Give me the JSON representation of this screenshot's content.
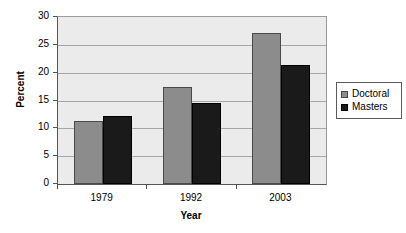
{
  "chart_data": {
    "type": "bar",
    "title": "",
    "xlabel": "Year",
    "ylabel": "Percent",
    "categories": [
      "1979",
      "1992",
      "2003"
    ],
    "series": [
      {
        "name": "Doctoral",
        "color": "#8c8c8c",
        "values": [
          11.4,
          17.4,
          27.2
        ]
      },
      {
        "name": "Masters",
        "color": "#1a1a1a",
        "values": [
          12.3,
          14.6,
          21.3
        ]
      }
    ],
    "ylim": [
      0,
      30
    ],
    "yticks": [
      0,
      5,
      10,
      15,
      20,
      25,
      30
    ],
    "ytick_labels": [
      "0",
      "5",
      "10",
      "15",
      "20",
      "25",
      "30"
    ],
    "grid": true,
    "legend_position": "right",
    "plot_background": "#ebebeb",
    "figure_background": "#ffffff"
  },
  "axes": {
    "y_title": "Percent",
    "x_title": "Year"
  },
  "legend": {
    "items": [
      {
        "label": "Doctoral"
      },
      {
        "label": "Masters"
      }
    ]
  }
}
